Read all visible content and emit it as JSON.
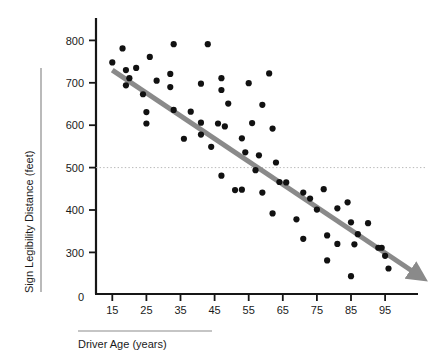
{
  "chart_data": {
    "type": "scatter",
    "title": "",
    "xlabel": "Driver Age (years)",
    "ylabel": "Sign Legibility Distance (feet)",
    "xlim": [
      10,
      100
    ],
    "ylim": [
      230,
      820
    ],
    "grid": false,
    "legend": null,
    "x_ticks": [
      15,
      25,
      35,
      45,
      55,
      65,
      75,
      85,
      95
    ],
    "x_tick_labels": [
      "15",
      "25",
      "35",
      "45",
      "55",
      "65",
      "75",
      "85",
      "95"
    ],
    "y_ticks": [
      300,
      400,
      500,
      600,
      700,
      800
    ],
    "y_tick_labels": [
      "300",
      "400",
      "500",
      "600",
      "700",
      "800"
    ],
    "origin_label": "0",
    "reference_line": {
      "orientation": "horizontal",
      "value": 500,
      "style": "dotted",
      "color": "#b9b9b9"
    },
    "trend_line": {
      "style": "solid-arrow",
      "color": "#8a8a8a",
      "width": 5,
      "x_start": 15,
      "y_start": 730,
      "x_end": 105,
      "y_end": 245,
      "description": "negative linear trend arrow"
    },
    "marker": {
      "shape": "circle",
      "color": "#111111",
      "size": 3.1
    },
    "series": [
      {
        "name": "Sign legibility distance by driver age",
        "points": [
          [
            15,
            748
          ],
          [
            18,
            781
          ],
          [
            19,
            730
          ],
          [
            19,
            694
          ],
          [
            20,
            711
          ],
          [
            22,
            735
          ],
          [
            24,
            673
          ],
          [
            25,
            631
          ],
          [
            25,
            604
          ],
          [
            26,
            761
          ],
          [
            28,
            705
          ],
          [
            32,
            721
          ],
          [
            32,
            690
          ],
          [
            33,
            791
          ],
          [
            33,
            636
          ],
          [
            36,
            568
          ],
          [
            38,
            632
          ],
          [
            41,
            698
          ],
          [
            41,
            606
          ],
          [
            41,
            578
          ],
          [
            43,
            791
          ],
          [
            44,
            549
          ],
          [
            46,
            604
          ],
          [
            47,
            711
          ],
          [
            47,
            683
          ],
          [
            47,
            481
          ],
          [
            48,
            597
          ],
          [
            49,
            651
          ],
          [
            51,
            447
          ],
          [
            53,
            448
          ],
          [
            53,
            569
          ],
          [
            54,
            536
          ],
          [
            55,
            699
          ],
          [
            56,
            605
          ],
          [
            57,
            494
          ],
          [
            58,
            529
          ],
          [
            59,
            648
          ],
          [
            59,
            441
          ],
          [
            61,
            722
          ],
          [
            62,
            592
          ],
          [
            62,
            392
          ],
          [
            63,
            512
          ],
          [
            64,
            466
          ],
          [
            66,
            465
          ],
          [
            69,
            378
          ],
          [
            71,
            441
          ],
          [
            71,
            332
          ],
          [
            73,
            427
          ],
          [
            75,
            401
          ],
          [
            77,
            449
          ],
          [
            78,
            340
          ],
          [
            78,
            281
          ],
          [
            81,
            404
          ],
          [
            81,
            320
          ],
          [
            84,
            418
          ],
          [
            85,
            244
          ],
          [
            85,
            371
          ],
          [
            86,
            319
          ],
          [
            87,
            343
          ],
          [
            90,
            369
          ],
          [
            93,
            311
          ],
          [
            94,
            311
          ],
          [
            95,
            292
          ],
          [
            96,
            262
          ]
        ]
      }
    ]
  },
  "axis_rules": {
    "x_rule_present": true,
    "y_rule_present": true
  }
}
